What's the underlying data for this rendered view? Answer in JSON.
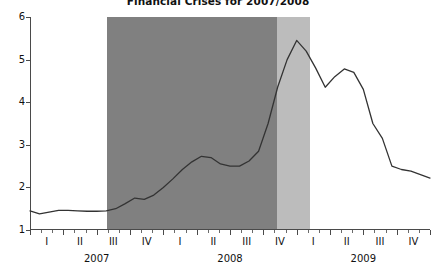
{
  "chart_data": {
    "type": "line",
    "title": "Financial Crises for 2007/2008",
    "xlabel": "",
    "ylabel": "",
    "ylim": [
      1,
      6
    ],
    "yticks": [
      1,
      2,
      3,
      4,
      5,
      6
    ],
    "grid": false,
    "legend": null,
    "x_axis": {
      "quarter_labels": [
        "I",
        "II",
        "III",
        "IV",
        "I",
        "II",
        "III",
        "IV",
        "I",
        "II",
        "III",
        "IV"
      ],
      "year_labels": [
        "2007",
        "2008",
        "2009"
      ],
      "minor_tick_interval": "month"
    },
    "series": [
      {
        "name": "spread",
        "x": [
          "2007-01",
          "2007-02",
          "2007-03",
          "2007-04",
          "2007-05",
          "2007-06",
          "2007-07",
          "2007-08",
          "2007-09",
          "2007-10",
          "2007-11",
          "2007-12",
          "2008-01",
          "2008-02",
          "2008-03",
          "2008-04",
          "2008-05",
          "2008-06",
          "2008-07",
          "2008-08",
          "2008-09",
          "2008-10",
          "2008-11",
          "2008-12",
          "2009-01",
          "2009-02",
          "2009-03",
          "2009-04",
          "2009-05",
          "2009-06",
          "2009-07",
          "2009-08",
          "2009-09",
          "2009-10",
          "2009-11",
          "2009-12"
        ],
        "values": [
          1.45,
          1.38,
          1.42,
          1.46,
          1.46,
          1.45,
          1.44,
          1.44,
          1.45,
          1.5,
          1.62,
          1.75,
          1.72,
          1.82,
          2.0,
          2.2,
          2.42,
          2.6,
          2.73,
          2.7,
          2.55,
          2.5,
          2.5,
          2.62,
          2.85,
          3.5,
          4.35,
          5.0,
          5.45,
          5.2,
          4.8,
          4.35,
          4.6,
          4.78,
          4.7,
          4.3
        ],
        "tail_x": [
          "2009-Q3b",
          "2009-Q4a",
          "2009-Q4b",
          "2009-Q4c"
        ],
        "tail_values": [
          3.5,
          3.15,
          2.5,
          2.42,
          2.38,
          2.3,
          2.22
        ],
        "color": "#333333"
      }
    ],
    "shaded_regions": [
      {
        "label": "crisis-main",
        "start_quarter_index": 2.3,
        "end_quarter_index": 7.4,
        "color": "#808080"
      },
      {
        "label": "crisis-peak",
        "start_quarter_index": 7.4,
        "end_quarter_index": 8.4,
        "color": "#bcbcbc"
      }
    ],
    "peak": {
      "value": 5.45,
      "approx_period": "2008-IV"
    },
    "secondary_peak": {
      "value": 4.8,
      "approx_period": "2009-I"
    },
    "final_value": 2.22
  }
}
